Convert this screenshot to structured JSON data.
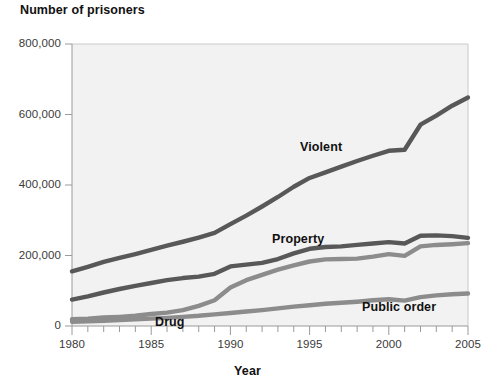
{
  "chart_data": {
    "type": "line",
    "title": "Number of prisoners",
    "xlabel": "Year",
    "ylabel": "Number of prisoners",
    "xlim": [
      1980,
      2005
    ],
    "ylim": [
      0,
      800000
    ],
    "grid": false,
    "legend_position": "inline-labels",
    "y_ticks": [
      "0",
      "200,000",
      "400,000",
      "600,000",
      "800,000"
    ],
    "y_tick_values": [
      0,
      200000,
      400000,
      600000,
      800000
    ],
    "x_ticks": [
      "1980",
      "1985",
      "1990",
      "1995",
      "2000",
      "2005"
    ],
    "x_tick_values": [
      1980,
      1985,
      1990,
      1995,
      2000,
      2005
    ],
    "x_minor_tick_step": 1,
    "x": [
      1980,
      1981,
      1982,
      1983,
      1984,
      1985,
      1986,
      1987,
      1988,
      1989,
      1990,
      1991,
      1992,
      1993,
      1994,
      1995,
      1996,
      1997,
      1998,
      1999,
      2000,
      2001,
      2002,
      2003,
      2004,
      2005
    ],
    "series": [
      {
        "name": "Violent",
        "color": "#585858",
        "label_x": 2000,
        "values": [
          155000,
          168000,
          182000,
          193000,
          204000,
          216000,
          228000,
          239000,
          251000,
          264000,
          289000,
          313000,
          339000,
          366000,
          395000,
          420000,
          436000,
          452000,
          468000,
          483000,
          497000,
          500000,
          571000,
          597000,
          625000,
          648000
        ]
      },
      {
        "name": "Property",
        "color": "#585858",
        "label_x": 1999,
        "values": [
          75000,
          84000,
          95000,
          105000,
          114000,
          122000,
          130000,
          136000,
          140000,
          148000,
          169000,
          174000,
          179000,
          190000,
          206000,
          219000,
          224000,
          226000,
          230000,
          234000,
          238000,
          234000,
          256000,
          257000,
          255000,
          250000
        ]
      },
      {
        "name": "Drug",
        "color": "#8c8c8c",
        "label_x": 1987,
        "values": [
          19000,
          21000,
          24000,
          26000,
          29000,
          34000,
          38000,
          45000,
          57000,
          73000,
          109000,
          130000,
          145000,
          160000,
          172000,
          183000,
          189000,
          190000,
          191000,
          197000,
          204000,
          199000,
          226000,
          230000,
          232000,
          235000
        ]
      },
      {
        "name": "Public order",
        "color": "#8c8c8c",
        "label_x": 2000,
        "values": [
          12000,
          13000,
          15000,
          17000,
          19000,
          21000,
          23000,
          26000,
          29000,
          33000,
          37000,
          41000,
          45000,
          50000,
          55000,
          59000,
          63000,
          66000,
          69000,
          73000,
          76000,
          72000,
          82000,
          87000,
          90000,
          92000
        ]
      }
    ],
    "series_inline_labels": [
      {
        "text": "Violent",
        "x": 300,
        "y": 140
      },
      {
        "text": "Property",
        "x": 272,
        "y": 232
      },
      {
        "text": "Drug",
        "x": 155,
        "y": 315
      },
      {
        "text": "Public order",
        "x": 362,
        "y": 300
      }
    ]
  },
  "plot": {
    "left": 72,
    "top": 44,
    "right": 468,
    "bottom": 326,
    "background": "#f2f2f2",
    "border_color": "#c9c9c9"
  }
}
